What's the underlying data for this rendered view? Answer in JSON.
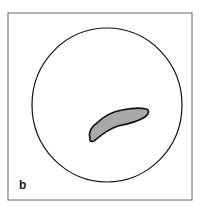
{
  "figure": {
    "panel_label": "b",
    "frame_color": "#555555",
    "circle_color": "#111111",
    "shape_fill": "#a9a9a9",
    "shape_stroke": "#111111"
  }
}
